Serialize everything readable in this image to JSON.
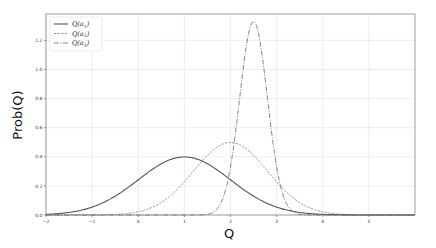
{
  "chart_data": {
    "type": "line",
    "title": "",
    "xlabel": "Q",
    "ylabel": "Prob(Q)",
    "xlim": [
      -2,
      6
    ],
    "ylim": [
      0,
      1.38
    ],
    "x_ticks": [
      "-2",
      "-1",
      "0",
      "1",
      "2",
      "3",
      "4",
      "5"
    ],
    "y_ticks": [
      "0.0",
      "0.2",
      "0.4",
      "0.6",
      "0.8",
      "1.0",
      "1.2"
    ],
    "grid": true,
    "legend_position": "upper left",
    "series": [
      {
        "name": "Q(a1)",
        "label_base": "Q(a",
        "label_sub": "1",
        "label_end": ")",
        "style": "solid",
        "color": "#555555",
        "distribution": "normal",
        "mean": 1.0,
        "std": 1.0,
        "peak": 0.4,
        "x": [
          -2,
          -1.5,
          -1,
          -0.5,
          0,
          0.5,
          1,
          1.5,
          2,
          2.5,
          3,
          3.5,
          4,
          4.5,
          5
        ],
        "y": [
          0.004,
          0.018,
          0.054,
          0.13,
          0.242,
          0.352,
          0.399,
          0.352,
          0.242,
          0.13,
          0.054,
          0.018,
          0.004,
          0.001,
          0.0
        ]
      },
      {
        "name": "Q(a2)",
        "label_base": "Q(a",
        "label_sub": "2",
        "label_end": ")",
        "style": "dashed",
        "color": "#777777",
        "distribution": "normal",
        "mean": 2.0,
        "std": 0.8,
        "peak": 0.5,
        "x": [
          -1,
          -0.5,
          0,
          0.5,
          1,
          1.5,
          2,
          2.5,
          3,
          3.5,
          4,
          4.5,
          5
        ],
        "y": [
          0.0,
          0.004,
          0.022,
          0.086,
          0.228,
          0.41,
          0.499,
          0.41,
          0.228,
          0.086,
          0.022,
          0.004,
          0.0
        ]
      },
      {
        "name": "Q(a3)",
        "label_base": "Q(a",
        "label_sub": "3",
        "label_end": ")",
        "style": "dashdot",
        "color": "#666666",
        "distribution": "normal",
        "mean": 2.5,
        "std": 0.3,
        "peak": 1.33,
        "x": [
          1.5,
          1.8,
          2.0,
          2.2,
          2.4,
          2.5,
          2.6,
          2.8,
          3.0,
          3.2,
          3.5
        ],
        "y": [
          0.005,
          0.087,
          0.332,
          0.807,
          1.258,
          1.33,
          1.258,
          0.807,
          0.332,
          0.087,
          0.005
        ]
      }
    ]
  }
}
